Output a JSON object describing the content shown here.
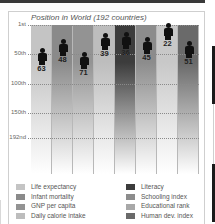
{
  "chart_data": {
    "type": "bar",
    "title": "Position in World (192 countries)",
    "xlabel": "",
    "ylabel": "Rank",
    "ylim": [
      1,
      192
    ],
    "y_inverted": true,
    "y_ticks": [
      "1st",
      "50th",
      "100th",
      "150th",
      "192nd"
    ],
    "grid": true,
    "legend_position": "bottom",
    "categories": [
      "Life expectancy",
      "Infant mortality",
      "GNP per capita",
      "Daily calorie intake",
      "Literacy",
      "Schooling index",
      "Educational rank",
      "Human dev. index"
    ],
    "values": [
      63,
      48,
      71,
      39,
      36,
      45,
      22,
      51
    ],
    "colors": [
      "#c4c4c4",
      "#8a8a8a",
      "#939393",
      "#bdbdbd",
      "#3c3c3c",
      "#8c8c8c",
      "#c8c8c8",
      "#6a6a6a"
    ]
  },
  "title": "Position in World (192 countries)",
  "axis": {
    "ticks": [
      {
        "label": "1st",
        "rank": 1
      },
      {
        "label": "50th",
        "rank": 50
      },
      {
        "label": "100th",
        "rank": 100
      },
      {
        "label": "150th",
        "rank": 150
      },
      {
        "label": "192nd",
        "rank": 192
      }
    ]
  },
  "bars": [
    {
      "label": "63",
      "value": 63
    },
    {
      "label": "48",
      "value": 48
    },
    {
      "label": "71",
      "value": 71
    },
    {
      "label": "39",
      "value": 39
    },
    {
      "label": "36",
      "value": 36
    },
    {
      "label": "45",
      "value": 45
    },
    {
      "label": "22",
      "value": 22
    },
    {
      "label": "51",
      "value": 51
    }
  ],
  "legend": {
    "left": [
      {
        "label": "Life expectancy",
        "color": "#c4c4c4"
      },
      {
        "label": "Infant mortality",
        "color": "#8a8a8a"
      },
      {
        "label": "GNP per capita",
        "color": "#939393"
      },
      {
        "label": "Daily calorie intake",
        "color": "#bdbdbd"
      }
    ],
    "right": [
      {
        "label": "Literacy",
        "color": "#3c3c3c"
      },
      {
        "label": "Schooling index",
        "color": "#8c8c8c"
      },
      {
        "label": "Educational rank",
        "color": "#a8a8a8"
      },
      {
        "label": "Human dev. index",
        "color": "#6a6a6a"
      }
    ]
  }
}
